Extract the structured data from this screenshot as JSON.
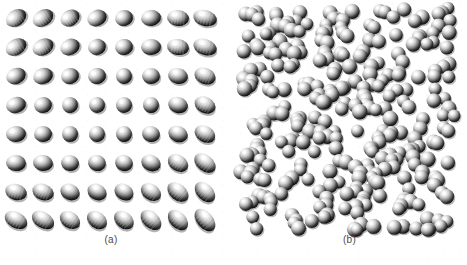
{
  "figure": {
    "background_color": "#ffffff",
    "width": 467,
    "height": 265,
    "caption_color": "#4a4a4a"
  },
  "panels": [
    {
      "id": "a",
      "label": "(a)",
      "description": "ordered crystalline lattice of ellipsoidal particles",
      "phase": "ordered / crystalline",
      "particle_shape": "ellipsoid",
      "particle_color": "#e8e8e8",
      "shadow_color": "#000000",
      "highlight_color": "#ffffff",
      "grid": {
        "rows": 8,
        "columns": 8,
        "count": 64
      },
      "bounds": {
        "x": 16,
        "y": 18,
        "width": 190,
        "height": 204
      },
      "spacing": {
        "x": 27,
        "y": 29
      },
      "orientation_note": "tilt angle varies smoothly from down-right at top to up-right at bottom; particles near middle rows face the viewer and appear circular"
    },
    {
      "id": "b",
      "label": "(b)",
      "description": "disordered fluid phase of randomly packed spheres",
      "phase": "disordered / fluid",
      "particle_shape": "sphere",
      "particle_color": "#dcdcdc",
      "shadow_color": "#000000",
      "highlight_color": "#ffffff",
      "count": 300,
      "ghost_count": 60,
      "bounds": {
        "x": 240,
        "y": 8,
        "width": 215,
        "height": 222
      },
      "sphere_radius_range": [
        5.5,
        8.5
      ]
    }
  ],
  "chart_data": {
    "type": "scatter",
    "title": "",
    "xlabel": "",
    "ylabel": "",
    "legend": [],
    "grid": false,
    "subplots": [
      {
        "label": "(a)",
        "kind": "lattice",
        "rows": 8,
        "columns": 8,
        "n_particles": 64,
        "xlim": [
          0,
          8
        ],
        "ylim": [
          0,
          8
        ],
        "particles": [
          {
            "row": 0,
            "col": 0,
            "x": 16,
            "y": 18,
            "rx": 11,
            "ry": 8,
            "angle": -34,
            "eccentricity": 0.72
          },
          {
            "row": 0,
            "col": 1,
            "x": 43,
            "y": 18,
            "rx": 11,
            "ry": 8,
            "angle": -32,
            "eccentricity": 0.72
          },
          {
            "row": 0,
            "col": 2,
            "x": 70,
            "y": 18,
            "rx": 10,
            "ry": 8,
            "angle": -30,
            "eccentricity": 0.78
          },
          {
            "row": 0,
            "col": 3,
            "x": 97,
            "y": 18,
            "rx": 10,
            "ry": 8,
            "angle": -24,
            "eccentricity": 0.8
          },
          {
            "row": 0,
            "col": 4,
            "x": 124,
            "y": 18,
            "rx": 9,
            "ry": 8,
            "angle": -16,
            "eccentricity": 0.86
          },
          {
            "row": 0,
            "col": 5,
            "x": 151,
            "y": 18,
            "rx": 10,
            "ry": 8,
            "angle": -8,
            "eccentricity": 0.82
          },
          {
            "row": 0,
            "col": 6,
            "x": 178,
            "y": 18,
            "rx": 11,
            "ry": 8,
            "angle": 4,
            "eccentricity": 0.74
          },
          {
            "row": 0,
            "col": 7,
            "x": 205,
            "y": 18,
            "rx": 12,
            "ry": 8,
            "angle": 14,
            "eccentricity": 0.68
          },
          {
            "row": 1,
            "col": 0,
            "x": 16,
            "y": 47,
            "rx": 11,
            "ry": 8,
            "angle": -30,
            "eccentricity": 0.74
          },
          {
            "row": 1,
            "col": 1,
            "x": 43,
            "y": 47,
            "rx": 11,
            "ry": 8,
            "angle": -27,
            "eccentricity": 0.75
          },
          {
            "row": 1,
            "col": 2,
            "x": 70,
            "y": 47,
            "rx": 10,
            "ry": 8,
            "angle": -24,
            "eccentricity": 0.8
          },
          {
            "row": 1,
            "col": 3,
            "x": 97,
            "y": 47,
            "rx": 9,
            "ry": 8,
            "angle": -18,
            "eccentricity": 0.85
          },
          {
            "row": 1,
            "col": 4,
            "x": 124,
            "y": 47,
            "rx": 9,
            "ry": 8,
            "angle": -10,
            "eccentricity": 0.88
          },
          {
            "row": 1,
            "col": 5,
            "x": 151,
            "y": 47,
            "rx": 10,
            "ry": 8,
            "angle": -2,
            "eccentricity": 0.83
          },
          {
            "row": 1,
            "col": 6,
            "x": 178,
            "y": 47,
            "rx": 11,
            "ry": 8,
            "angle": 8,
            "eccentricity": 0.75
          },
          {
            "row": 1,
            "col": 7,
            "x": 205,
            "y": 47,
            "rx": 12,
            "ry": 8,
            "angle": 18,
            "eccentricity": 0.66
          },
          {
            "row": 2,
            "col": 0,
            "x": 16,
            "y": 76,
            "rx": 10,
            "ry": 8,
            "angle": -22,
            "eccentricity": 0.8
          },
          {
            "row": 2,
            "col": 1,
            "x": 43,
            "y": 76,
            "rx": 10,
            "ry": 8,
            "angle": -20,
            "eccentricity": 0.81
          },
          {
            "row": 2,
            "col": 2,
            "x": 70,
            "y": 76,
            "rx": 9,
            "ry": 8,
            "angle": -16,
            "eccentricity": 0.87
          },
          {
            "row": 2,
            "col": 3,
            "x": 97,
            "y": 76,
            "rx": 9,
            "ry": 8,
            "angle": -10,
            "eccentricity": 0.9
          },
          {
            "row": 2,
            "col": 4,
            "x": 124,
            "y": 76,
            "rx": 8,
            "ry": 8,
            "angle": -4,
            "eccentricity": 0.96
          },
          {
            "row": 2,
            "col": 5,
            "x": 151,
            "y": 76,
            "rx": 9,
            "ry": 8,
            "angle": 4,
            "eccentricity": 0.89
          },
          {
            "row": 2,
            "col": 6,
            "x": 178,
            "y": 76,
            "rx": 10,
            "ry": 8,
            "angle": 12,
            "eccentricity": 0.8
          },
          {
            "row": 2,
            "col": 7,
            "x": 205,
            "y": 76,
            "rx": 11,
            "ry": 8,
            "angle": 22,
            "eccentricity": 0.72
          },
          {
            "row": 3,
            "col": 0,
            "x": 16,
            "y": 105,
            "rx": 10,
            "ry": 8,
            "angle": -14,
            "eccentricity": 0.83
          },
          {
            "row": 3,
            "col": 1,
            "x": 43,
            "y": 105,
            "rx": 9,
            "ry": 8,
            "angle": -12,
            "eccentricity": 0.88
          },
          {
            "row": 3,
            "col": 2,
            "x": 70,
            "y": 105,
            "rx": 8,
            "ry": 8,
            "angle": -8,
            "eccentricity": 0.95
          },
          {
            "row": 3,
            "col": 3,
            "x": 97,
            "y": 105,
            "rx": 8,
            "ry": 8,
            "angle": -2,
            "eccentricity": 0.99
          },
          {
            "row": 3,
            "col": 4,
            "x": 124,
            "y": 105,
            "rx": 8,
            "ry": 8,
            "angle": 2,
            "eccentricity": 1.0
          },
          {
            "row": 3,
            "col": 5,
            "x": 151,
            "y": 105,
            "rx": 8,
            "ry": 8,
            "angle": 8,
            "eccentricity": 0.96
          },
          {
            "row": 3,
            "col": 6,
            "x": 178,
            "y": 105,
            "rx": 10,
            "ry": 8,
            "angle": 16,
            "eccentricity": 0.84
          },
          {
            "row": 3,
            "col": 7,
            "x": 205,
            "y": 105,
            "rx": 11,
            "ry": 8,
            "angle": 26,
            "eccentricity": 0.74
          },
          {
            "row": 4,
            "col": 0,
            "x": 16,
            "y": 134,
            "rx": 10,
            "ry": 8,
            "angle": -6,
            "eccentricity": 0.84
          },
          {
            "row": 4,
            "col": 1,
            "x": 43,
            "y": 134,
            "rx": 9,
            "ry": 8,
            "angle": -4,
            "eccentricity": 0.9
          },
          {
            "row": 4,
            "col": 2,
            "x": 70,
            "y": 134,
            "rx": 8,
            "ry": 8,
            "angle": 0,
            "eccentricity": 0.98
          },
          {
            "row": 4,
            "col": 3,
            "x": 97,
            "y": 134,
            "rx": 8,
            "ry": 8,
            "angle": 4,
            "eccentricity": 1.0
          },
          {
            "row": 4,
            "col": 4,
            "x": 124,
            "y": 134,
            "rx": 8,
            "ry": 8,
            "angle": 8,
            "eccentricity": 0.98
          },
          {
            "row": 4,
            "col": 5,
            "x": 151,
            "y": 134,
            "rx": 9,
            "ry": 8,
            "angle": 14,
            "eccentricity": 0.92
          },
          {
            "row": 4,
            "col": 6,
            "x": 178,
            "y": 134,
            "rx": 10,
            "ry": 8,
            "angle": 22,
            "eccentricity": 0.82
          },
          {
            "row": 4,
            "col": 7,
            "x": 205,
            "y": 134,
            "rx": 11,
            "ry": 8,
            "angle": 30,
            "eccentricity": 0.72
          },
          {
            "row": 5,
            "col": 0,
            "x": 16,
            "y": 163,
            "rx": 10,
            "ry": 8,
            "angle": 4,
            "eccentricity": 0.82
          },
          {
            "row": 5,
            "col": 1,
            "x": 43,
            "y": 163,
            "rx": 10,
            "ry": 8,
            "angle": 8,
            "eccentricity": 0.86
          },
          {
            "row": 5,
            "col": 2,
            "x": 70,
            "y": 163,
            "rx": 9,
            "ry": 8,
            "angle": 12,
            "eccentricity": 0.92
          },
          {
            "row": 5,
            "col": 3,
            "x": 97,
            "y": 163,
            "rx": 9,
            "ry": 8,
            "angle": 16,
            "eccentricity": 0.94
          },
          {
            "row": 5,
            "col": 4,
            "x": 124,
            "y": 163,
            "rx": 9,
            "ry": 8,
            "angle": 20,
            "eccentricity": 0.9
          },
          {
            "row": 5,
            "col": 5,
            "x": 151,
            "y": 163,
            "rx": 10,
            "ry": 8,
            "angle": 25,
            "eccentricity": 0.84
          },
          {
            "row": 5,
            "col": 6,
            "x": 178,
            "y": 163,
            "rx": 11,
            "ry": 8,
            "angle": 32,
            "eccentricity": 0.76
          },
          {
            "row": 5,
            "col": 7,
            "x": 205,
            "y": 163,
            "rx": 12,
            "ry": 8,
            "angle": 38,
            "eccentricity": 0.68
          },
          {
            "row": 6,
            "col": 0,
            "x": 16,
            "y": 192,
            "rx": 11,
            "ry": 8,
            "angle": 16,
            "eccentricity": 0.76
          },
          {
            "row": 6,
            "col": 1,
            "x": 43,
            "y": 192,
            "rx": 11,
            "ry": 8,
            "angle": 20,
            "eccentricity": 0.78
          },
          {
            "row": 6,
            "col": 2,
            "x": 70,
            "y": 192,
            "rx": 10,
            "ry": 8,
            "angle": 24,
            "eccentricity": 0.84
          },
          {
            "row": 6,
            "col": 3,
            "x": 97,
            "y": 192,
            "rx": 10,
            "ry": 8,
            "angle": 28,
            "eccentricity": 0.86
          },
          {
            "row": 6,
            "col": 4,
            "x": 124,
            "y": 192,
            "rx": 10,
            "ry": 8,
            "angle": 31,
            "eccentricity": 0.83
          },
          {
            "row": 6,
            "col": 5,
            "x": 151,
            "y": 192,
            "rx": 11,
            "ry": 8,
            "angle": 35,
            "eccentricity": 0.78
          },
          {
            "row": 6,
            "col": 6,
            "x": 178,
            "y": 192,
            "rx": 12,
            "ry": 8,
            "angle": 40,
            "eccentricity": 0.7
          },
          {
            "row": 6,
            "col": 7,
            "x": 205,
            "y": 192,
            "rx": 12,
            "ry": 8,
            "angle": 45,
            "eccentricity": 0.66
          },
          {
            "row": 7,
            "col": 0,
            "x": 16,
            "y": 220,
            "rx": 12,
            "ry": 8,
            "angle": 28,
            "eccentricity": 0.68
          },
          {
            "row": 7,
            "col": 1,
            "x": 43,
            "y": 220,
            "rx": 12,
            "ry": 8,
            "angle": 31,
            "eccentricity": 0.68
          },
          {
            "row": 7,
            "col": 2,
            "x": 70,
            "y": 220,
            "rx": 11,
            "ry": 8,
            "angle": 34,
            "eccentricity": 0.74
          },
          {
            "row": 7,
            "col": 3,
            "x": 97,
            "y": 220,
            "rx": 11,
            "ry": 8,
            "angle": 37,
            "eccentricity": 0.76
          },
          {
            "row": 7,
            "col": 4,
            "x": 124,
            "y": 220,
            "rx": 11,
            "ry": 8,
            "angle": 40,
            "eccentricity": 0.74
          },
          {
            "row": 7,
            "col": 5,
            "x": 151,
            "y": 220,
            "rx": 12,
            "ry": 8,
            "angle": 43,
            "eccentricity": 0.7
          },
          {
            "row": 7,
            "col": 6,
            "x": 178,
            "y": 220,
            "rx": 12,
            "ry": 8,
            "angle": 47,
            "eccentricity": 0.66
          },
          {
            "row": 7,
            "col": 7,
            "x": 205,
            "y": 220,
            "rx": 13,
            "ry": 8,
            "angle": 50,
            "eccentricity": 0.62
          }
        ]
      },
      {
        "label": "(b)",
        "kind": "random_packing",
        "n_particles": 300,
        "xlim": [
          0,
          215
        ],
        "ylim": [
          0,
          222
        ],
        "seed": 20240917,
        "radius_mean": 7.0,
        "radius_jitter": 1.5,
        "note": "positions generated pseudo-randomly with a fixed seed to reproduce a dense disordered fluid; a faint back-layer of ghosted spheres is drawn behind the solid ones"
      }
    ]
  }
}
